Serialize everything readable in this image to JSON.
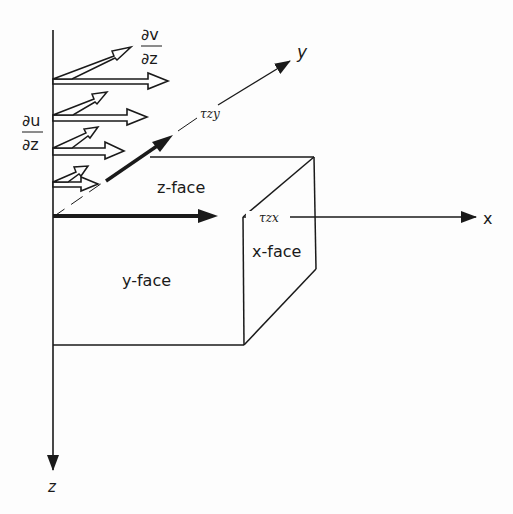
{
  "diagram": {
    "axes": {
      "x": "x",
      "y": "y",
      "z": "z"
    },
    "faces": {
      "z_face": "z-face",
      "y_face": "y-face",
      "x_face": "x-face"
    },
    "stresses": {
      "tau_zy": "τzy",
      "tau_zx": "τzx"
    },
    "gradients": {
      "du_dz_num": "∂u",
      "du_dz_den": "∂z",
      "dv_dz_num": "∂v",
      "dv_dz_den": "∂z"
    },
    "colors": {
      "ink": "#1a1a1a",
      "background": "#fdfdfd"
    }
  }
}
